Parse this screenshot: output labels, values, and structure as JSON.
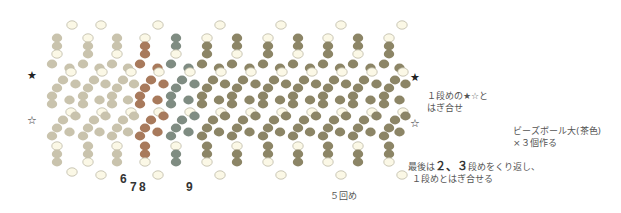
{
  "diagram": {
    "colors": {
      "bead_faded": "#c9c3ad",
      "bead_main": "#8c8566",
      "bead_outline_fill": "#fbf8e6",
      "bead_outline_stroke": "#bdb9a6",
      "thread_red": "#e0623c",
      "thread_blue": "#5aa8d6",
      "bead_red_tint": "#a87a5c",
      "bead_blue_tint": "#7f8c82",
      "arrow": "#8fd3ec",
      "ball_outline": "#6e6a55"
    },
    "pillar_x": [
      57,
      88,
      117,
      145,
      176,
      207,
      237,
      268,
      298,
      328,
      358,
      389
    ],
    "faded_until_index": 3,
    "red_index": 3,
    "blue_index": 4,
    "edge_x": 416
  },
  "markers": {
    "star_filled": "★",
    "star_outline": "☆"
  },
  "labels": {
    "thread_numbers": [
      "6",
      "7",
      "8",
      "9"
    ],
    "join_note_line1": "１段めの★☆と",
    "join_note_line2": "はぎ合せ",
    "repeat_label": "５回め",
    "last_note_line1_pre": "最後は",
    "last_note_line1_bold": "２、３",
    "last_note_line1_post": "段めをくり返し、",
    "last_note_line2": "１段めとはぎ合せる",
    "result_line1": "ビーズボール大(茶色)",
    "result_line2": "×３個作る"
  }
}
